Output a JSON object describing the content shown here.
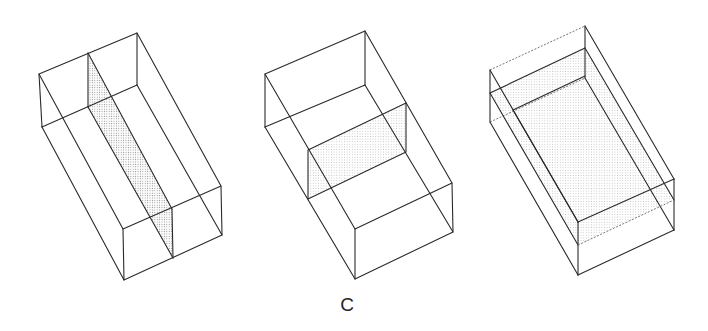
{
  "figure": {
    "label": "C",
    "panels": [
      {
        "id": "box-1",
        "description": "Rectangular box cut by a vertical longitudinal plane (shaded)"
      },
      {
        "id": "box-2",
        "description": "Rectangular box cut by a vertical transverse plane (shaded)"
      },
      {
        "id": "box-3",
        "description": "Rectangular box cut by a horizontal plane (shaded)"
      }
    ],
    "colors": {
      "line": "#2a2a2a",
      "shade": "#d9d9d9"
    }
  }
}
